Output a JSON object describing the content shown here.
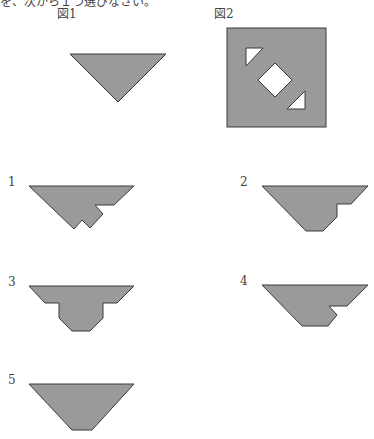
{
  "header": {
    "cutoff_text": "を、次から１つ選びなさい。"
  },
  "figures": {
    "fig1": {
      "label": "図1",
      "description": "downward-pointing right isosceles triangle"
    },
    "fig2": {
      "label": "図2",
      "description": "square with two small triangular holes and a diamond hole along the diagonal"
    }
  },
  "options": [
    {
      "number": "1",
      "description": "triangle with notched lower right edge"
    },
    {
      "number": "2",
      "description": "trapezoid-like shape with step on right"
    },
    {
      "number": "3",
      "description": "T-like symmetric shape with shoulders"
    },
    {
      "number": "4",
      "description": "trapezoid with notch on right"
    },
    {
      "number": "5",
      "description": "truncated inverted triangle (trapezoid)"
    }
  ],
  "colors": {
    "fill": "#9a9a9a",
    "stroke": "#3a3a3a",
    "hole": "#ffffff"
  }
}
